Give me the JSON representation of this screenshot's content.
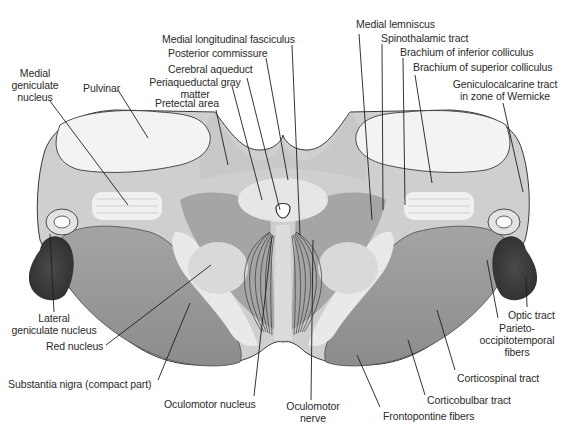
{
  "figure": {
    "labels": {
      "medial_longitudinal_fasciculus": "Medial longitudinal fasciculus",
      "posterior_commissure": "Posterior commissure",
      "cerebral_aqueduct": "Cerebral aqueduct",
      "periaqueductal_gray_1": "Periaqueductal gray",
      "periaqueductal_gray_2": "matter",
      "pretectal_area": "Pretectal area",
      "medial_geniculate_1": "Medial",
      "medial_geniculate_2": "geniculate",
      "medial_geniculate_3": "nucleus",
      "pulvinar": "Pulvinar",
      "medial_lemniscus": "Medial lemniscus",
      "spinothalamic_tract": "Spinothalamic tract",
      "brachium_inferior_colliculus": "Brachium of inferior colliculus",
      "brachium_superior_colliculus": "Brachium of superior colliculus",
      "geniculocalcarine_1": "Geniculocalcarine tract",
      "geniculocalcarine_2": "in zone of Wernicke",
      "lateral_geniculate_1": "Lateral",
      "lateral_geniculate_2": "geniculate nucleus",
      "red_nucleus": "Red nucleus",
      "substantia_nigra": "Substantia nigra (compact part)",
      "oculomotor_nucleus": "Oculomotor nucleus",
      "oculomotor_nerve_1": "Oculomotor",
      "oculomotor_nerve_2": "nerve",
      "frontopontine_fibers": "Frontopontine fibers",
      "corticobulbar_tract": "Corticobulbar tract",
      "corticospinal_tract": "Corticospinal tract",
      "parieto_1": "Parieto-",
      "parieto_2": "occipitotemporal",
      "parieto_3": "fibers",
      "optic_tract": "Optic tract"
    },
    "colors": {
      "background": "#ffffff",
      "outline": "#3a3a3a",
      "light_tissue": "#eeeeee",
      "mid_tissue": "#b8b8b8",
      "dark_tissue": "#8a8a8a",
      "optic_tract": "#3c3c3c",
      "label_text": "#2a2a2a"
    }
  }
}
